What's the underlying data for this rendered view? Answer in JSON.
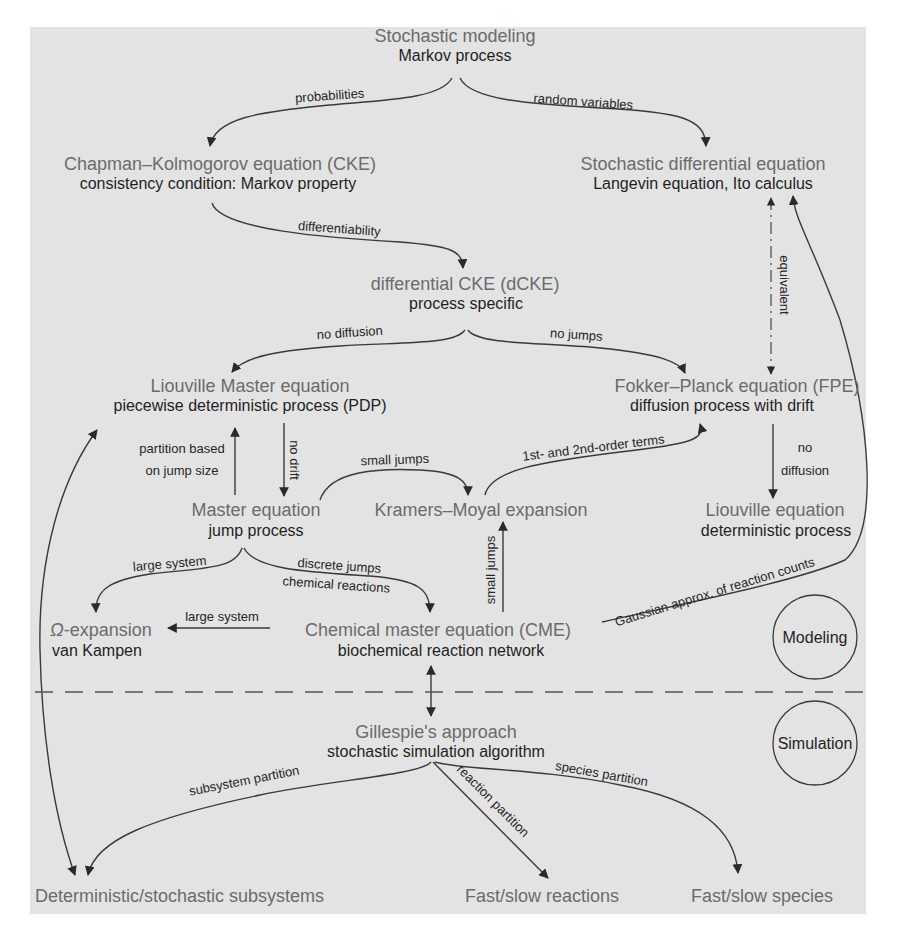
{
  "nodes": {
    "stochastic_modeling": {
      "title": "Stochastic modeling",
      "subtitle": "Markov process"
    },
    "cke": {
      "title": "Chapman–Kolmogorov equation (CKE)",
      "subtitle": "consistency condition: Markov property"
    },
    "sde": {
      "title": "Stochastic differential equation",
      "subtitle": "Langevin equation, Ito calculus"
    },
    "dcke": {
      "title": "differential CKE (dCKE)",
      "subtitle": "process specific"
    },
    "liouville_master": {
      "title": "Liouville Master equation",
      "subtitle": "piecewise deterministic process (PDP)"
    },
    "fpe": {
      "title": "Fokker–Planck equation (FPE)",
      "subtitle": "diffusion process with drift"
    },
    "master": {
      "title": "Master equation",
      "subtitle": "jump process"
    },
    "kramers_moyal": {
      "title": "Kramers–Moyal expansion"
    },
    "liouville": {
      "title": "Liouville equation",
      "subtitle": "deterministic process"
    },
    "omega": {
      "title_symbol": "Ω",
      "title_rest": "-expansion",
      "subtitle": "van Kampen"
    },
    "cme": {
      "title": "Chemical master equation (CME)",
      "subtitle": "biochemical reaction network"
    },
    "gillespie": {
      "title": "Gillespie's approach",
      "subtitle": "stochastic simulation algorithm"
    },
    "det_stoch": {
      "title": "Deterministic/stochastic subsystems"
    },
    "fast_slow_reactions": {
      "title": "Fast/slow reactions"
    },
    "fast_slow_species": {
      "title": "Fast/slow species"
    }
  },
  "edges": {
    "probabilities": "probabilities",
    "random_variables": "random variables",
    "differentiability": "differentiability",
    "equivalent": "equivalent",
    "no_diffusion_left": "no diffusion",
    "no_jumps": "no jumps",
    "partition_line1": "partition based",
    "partition_line2": "on jump size",
    "no_drift": "no drift",
    "small_jumps_top": "small jumps",
    "first_second_order": "1st- and 2nd-order terms",
    "no_diffusion_right_1": "no",
    "no_diffusion_right_2": "diffusion",
    "large_system_top": "large system",
    "discrete_jumps": "discrete jumps",
    "chemical_reactions": "chemical reactions",
    "small_jumps_vertical": "small jumps",
    "large_system_cme": "large system",
    "gaussian_approx": "Gaussian approx. of reaction counts",
    "subsystem_partition": "subsystem partition",
    "reaction_partition": "reaction partition",
    "species_partition": "species partition"
  },
  "regions": {
    "modeling": "Modeling",
    "simulation": "Simulation"
  },
  "colors": {
    "panel_background": "#e3e3e3",
    "node_title": "#6b6b6b",
    "node_subtitle": "#1f1f1f",
    "edge": "#3a3a3a"
  }
}
